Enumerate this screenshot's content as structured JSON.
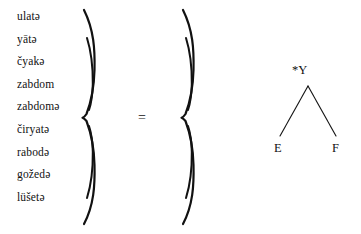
{
  "figure": {
    "type": "linguistic-equation-diagram",
    "ink_color": "#111111",
    "background_color": "#ffffff"
  },
  "word_list": {
    "items": [
      {
        "text": "ulatə"
      },
      {
        "text": "yātə"
      },
      {
        "text": "čyakə"
      },
      {
        "text": "zabdom"
      },
      {
        "text": "zabdomə"
      },
      {
        "text": "čiryatə"
      },
      {
        "text": "rabodə"
      },
      {
        "text": "gožedə"
      },
      {
        "text": "lüšetə"
      }
    ]
  },
  "braces": {
    "left": {
      "glyph": "}",
      "orientation": "right-facing"
    },
    "right": {
      "glyph": "}",
      "orientation": "right-facing"
    }
  },
  "relation": {
    "symbol": "="
  },
  "tree": {
    "root": {
      "label": "*Y"
    },
    "leaves": [
      {
        "label": "E"
      },
      {
        "label": "F"
      }
    ]
  }
}
